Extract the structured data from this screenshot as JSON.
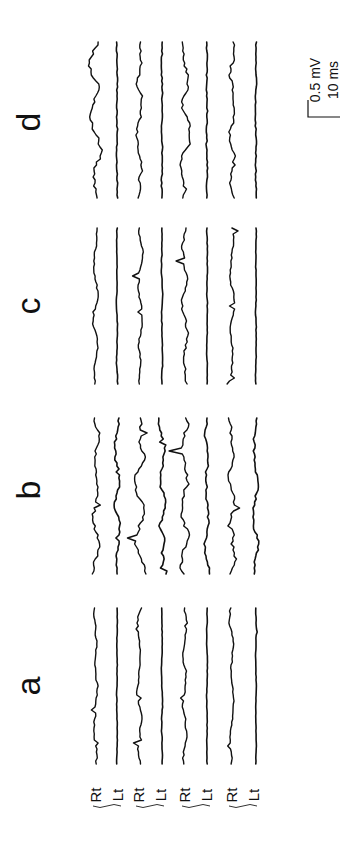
{
  "chart_data": {
    "type": "line",
    "title": "",
    "orientation": "rotated-90deg",
    "panels": [
      {
        "label": "a",
        "traces": [
          "Rt",
          "Lt",
          "Rt",
          "Lt",
          "Rt",
          "Lt",
          "Rt",
          "Lt"
        ]
      },
      {
        "label": "b",
        "traces": [
          "Rt",
          "Lt",
          "Rt",
          "Lt",
          "Rt",
          "Lt",
          "Rt",
          "Lt"
        ]
      },
      {
        "label": "c",
        "traces": [
          "Rt",
          "Lt",
          "Rt",
          "Lt",
          "Rt",
          "Lt",
          "Rt",
          "Lt"
        ]
      },
      {
        "label": "d",
        "traces": [
          "Rt",
          "Lt",
          "Rt",
          "Lt",
          "Rt",
          "Lt",
          "Rt",
          "Lt"
        ]
      }
    ],
    "trace_labels": [
      "Rt",
      "Lt",
      "Rt",
      "Lt",
      "Rt",
      "Lt",
      "Rt",
      "Lt"
    ],
    "pairs": 4,
    "scale_bar": {
      "amplitude": "0.5 mV",
      "time": "10 ms"
    },
    "xlabel": "",
    "ylabel": "",
    "grid": false,
    "legend": "none"
  },
  "panels": {
    "a": "a",
    "b": "b",
    "c": "c",
    "d": "d"
  },
  "labels": [
    "Rt",
    "Lt",
    "Rt",
    "Lt",
    "Rt",
    "Lt",
    "Rt",
    "Lt"
  ],
  "scale": {
    "amplitude": "0.5 mV",
    "time": "10 ms"
  }
}
